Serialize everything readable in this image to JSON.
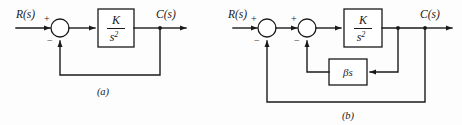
{
  "figure": {
    "name": "block-diagram-figure",
    "background_color": "#fdfdfd",
    "line_color": "#1a1a1a",
    "diagrams": [
      {
        "id": "a",
        "caption": "(a)",
        "input_label": "R(s)",
        "output_label": "C(s)",
        "summing_junctions": [
          {
            "id": "sum-a1",
            "plus": "+",
            "minus": "−"
          }
        ],
        "blocks": [
          {
            "id": "plant-a",
            "numerator": "K",
            "denominator_base": "s",
            "denominator_exp": "2"
          }
        ],
        "feedback_paths": [
          {
            "id": "outer-feedback-a",
            "label": ""
          }
        ]
      },
      {
        "id": "b",
        "caption": "(b)",
        "input_label": "R(s)",
        "output_label": "C(s)",
        "summing_junctions": [
          {
            "id": "sum-b1",
            "plus": "+",
            "minus": "−"
          },
          {
            "id": "sum-b2",
            "plus": "+",
            "minus": "−"
          }
        ],
        "blocks": [
          {
            "id": "plant-b",
            "numerator": "K",
            "denominator_base": "s",
            "denominator_exp": "2"
          },
          {
            "id": "rate-feedback-b",
            "label": "βs"
          }
        ],
        "feedback_paths": [
          {
            "id": "inner-feedback-b",
            "label": "βs"
          },
          {
            "id": "outer-feedback-b",
            "label": ""
          }
        ]
      }
    ]
  }
}
